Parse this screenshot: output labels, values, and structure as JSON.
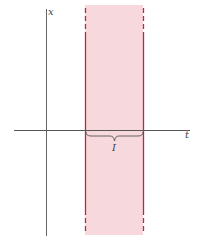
{
  "figure": {
    "axes": {
      "vertical_label": "x",
      "horizontal_label": "t"
    },
    "interval": {
      "label": "I",
      "band_color": "#f7d9dd",
      "boundary_color": "#c0283a"
    },
    "axis_color": "#555555"
  }
}
